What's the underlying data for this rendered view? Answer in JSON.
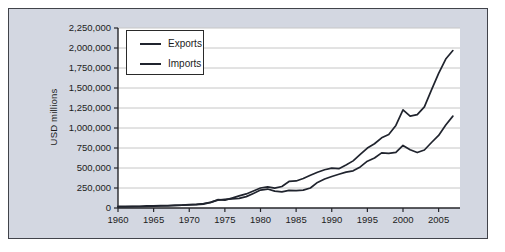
{
  "page": {
    "background": "#ffffff"
  },
  "figure": {
    "background": "#d3d7e1",
    "border_color": "#41434a"
  },
  "chart_data": {
    "type": "line",
    "title": "",
    "xlabel": "",
    "ylabel": "USD millions",
    "x": [
      1960,
      1961,
      1962,
      1963,
      1964,
      1965,
      1966,
      1967,
      1968,
      1969,
      1970,
      1971,
      1972,
      1973,
      1974,
      1975,
      1976,
      1977,
      1978,
      1979,
      1980,
      1981,
      1982,
      1983,
      1984,
      1985,
      1986,
      1987,
      1988,
      1989,
      1990,
      1991,
      1992,
      1993,
      1994,
      1995,
      1996,
      1997,
      1998,
      1999,
      2000,
      2001,
      2002,
      2003,
      2004,
      2005,
      2006,
      2007
    ],
    "series": [
      {
        "name": "Exports",
        "color": "#20242e",
        "values": [
          20000,
          20000,
          21000,
          22000,
          26000,
          27000,
          29000,
          31000,
          34000,
          37000,
          42000,
          43000,
          49000,
          71000,
          98000,
          107000,
          115000,
          121000,
          142000,
          182000,
          224000,
          237000,
          211000,
          202000,
          220000,
          216000,
          223000,
          250000,
          320000,
          362000,
          394000,
          422000,
          448000,
          465000,
          513000,
          585000,
          625000,
          689000,
          682000,
          696000,
          782000,
          729000,
          693000,
          725000,
          819000,
          907000,
          1038000,
          1148000
        ]
      },
      {
        "name": "Imports",
        "color": "#20242e",
        "values": [
          15000,
          15000,
          16000,
          17000,
          19000,
          22000,
          25000,
          27000,
          33000,
          36000,
          40000,
          46000,
          56000,
          70000,
          104000,
          98000,
          124000,
          152000,
          176000,
          212000,
          250000,
          265000,
          248000,
          269000,
          332000,
          338000,
          368000,
          410000,
          447000,
          478000,
          498000,
          491000,
          537000,
          589000,
          669000,
          749000,
          803000,
          877000,
          919000,
          1032000,
          1227000,
          1148000,
          1167000,
          1264000,
          1477000,
          1682000,
          1862000,
          1968000
        ]
      }
    ],
    "xlim": [
      1960,
      2008
    ],
    "ylim": [
      0,
      2250000
    ],
    "xticks": [
      1960,
      1965,
      1970,
      1975,
      1980,
      1985,
      1990,
      1995,
      2000,
      2005
    ],
    "xtick_labels": [
      "1960",
      "1965",
      "1970",
      "1975",
      "1980",
      "1985",
      "1990",
      "1995",
      "2000",
      "2005"
    ],
    "yticks": [
      0,
      250000,
      500000,
      750000,
      1000000,
      1250000,
      1500000,
      1750000,
      2000000,
      2250000
    ],
    "ytick_labels": [
      "0",
      "250,000",
      "500,000",
      "750,000",
      "1,000,000",
      "1,250,000",
      "1,500,000",
      "1,750,000",
      "2,000,000",
      "2,250,000"
    ],
    "grid": "horizontal",
    "gridline_color": "#c6c6c6",
    "axis_color": "#26262a",
    "tick_label_color": "#1c1c1c",
    "plot_background": "#ffffff",
    "legend_position": "top-left"
  }
}
